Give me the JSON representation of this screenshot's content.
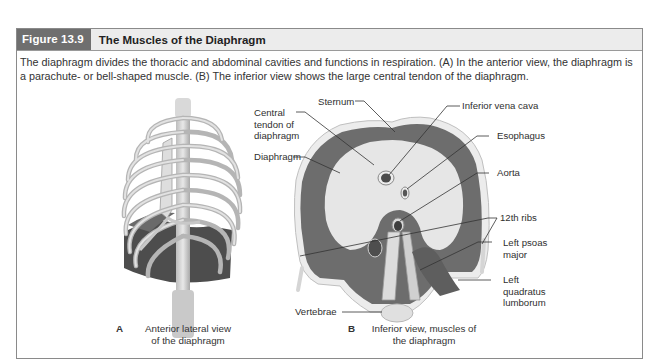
{
  "figure": {
    "number_label": "Figure 13.9",
    "title": "The Muscles of the Diaphragm",
    "caption": "The diaphragm divides the thoracic and abdominal cavities and functions in respiration. (A) In the anterior view, the diaphragm is a parachute- or bell-shaped muscle. (B) The inferior view shows the large central tendon of the diaphragm.",
    "colors": {
      "header_label_bg": "#6f6f6f",
      "header_bg": "#ececec",
      "border": "#8a8a8a",
      "muscle_dark": "#5a5a5a",
      "tendon_light": "#e6e6e6"
    }
  },
  "panel_a": {
    "letter": "A",
    "subtitle": "Anterior lateral view\nof the diaphragm"
  },
  "panel_b": {
    "letter": "B",
    "subtitle": "Inferior view, muscles of\nthe diaphragm",
    "labels": {
      "sternum": "Sternum",
      "central_tendon": "Central\ntendon of\ndiaphragm",
      "diaphragm": "Diaphragm",
      "inferior_vena_cava": "Inferior vena cava",
      "esophagus": "Esophagus",
      "aorta": "Aorta",
      "ribs_12th": "12th ribs",
      "left_psoas_major": "Left psoas\nmajor",
      "left_quadratus_lumborum": "Left\nquadratus\nlumborum",
      "vertebrae": "Vertebrae"
    }
  }
}
